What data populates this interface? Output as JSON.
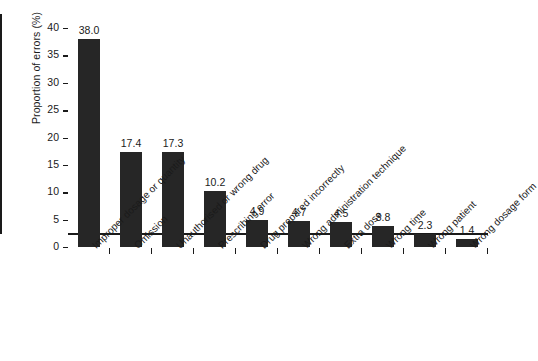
{
  "chart_data": {
    "type": "bar",
    "title": "",
    "xlabel": "",
    "ylabel": "Proportion of errors (%)",
    "ylim": [
      0,
      40
    ],
    "yticks": [
      "0",
      "5",
      "10",
      "15",
      "20",
      "25",
      "30",
      "35",
      "40"
    ],
    "grid": false,
    "legend": null,
    "bar_color": "#262626",
    "categories": [
      "Improper dosage or quantity",
      "Omission",
      "Unauthorised or wrong drug",
      "Prescribing error",
      "Drug prepared incorrectly",
      "Wrong administration technique",
      "Extra dose",
      "Wrong time",
      "Wrong patient",
      "Wrong dosage form"
    ],
    "values": [
      38.0,
      17.4,
      17.3,
      10.2,
      4.9,
      4.7,
      4.5,
      3.8,
      2.3,
      1.4
    ],
    "value_labels": [
      "38.0",
      "17.4",
      "17.3",
      "10.2",
      "4.9",
      "4.7",
      "4.5",
      "3.8",
      "2.3",
      "1.4"
    ]
  }
}
